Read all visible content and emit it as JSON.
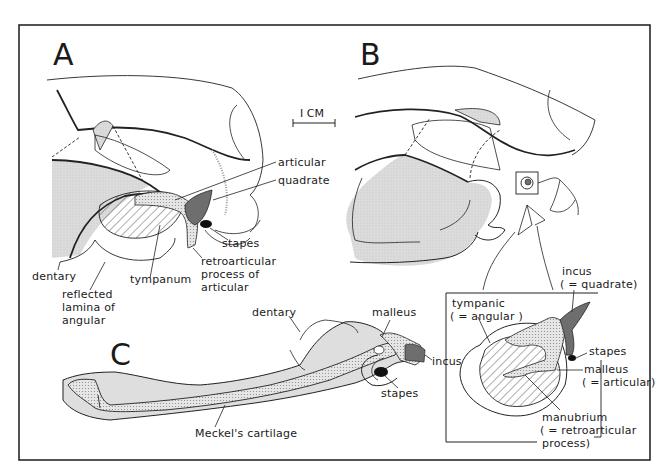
{
  "figure": {
    "panels": {
      "A": {
        "letter": "A",
        "labels": {
          "articular": "articular",
          "quadrate": "quadrate",
          "stapes": "stapes",
          "retroarticular_1": "retroarticular",
          "retroarticular_2": "process  of",
          "retroarticular_3": "articular",
          "dentary": "dentary",
          "tympanum": "tympanum",
          "reflected_1": "reflected",
          "reflected_2": "lamina of",
          "reflected_3": "angular"
        }
      },
      "B": {
        "letter": "B",
        "inset": {
          "tympanic_1": "tympanic",
          "tympanic_2": "( = angular )",
          "incus_1": "incus",
          "incus_2": "( = quadrate)",
          "stapes": "stapes",
          "malleus_1": "malleus",
          "malleus_2": "( = articular)",
          "manubrium_1": "manubrium",
          "manubrium_2": "( = retroarticular",
          "manubrium_3": "process)"
        }
      },
      "C": {
        "letter": "C",
        "labels": {
          "dentary": "dentary",
          "malleus": "malleus",
          "incus": "incus",
          "stapes": "stapes",
          "meckels": "Meckel's cartilage"
        }
      }
    },
    "scale_bar": "I CM",
    "colors": {
      "ink": "#1a1a1a",
      "stipple_light": "#d9d9d9",
      "stipple_mid": "#bdbdbd",
      "dark_fill": "#6e6e6e",
      "black_fill": "#111111"
    }
  }
}
